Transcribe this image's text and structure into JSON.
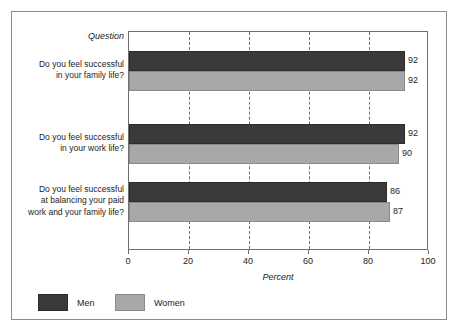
{
  "chart_data": {
    "type": "bar",
    "orientation": "horizontal",
    "title": "",
    "xlabel": "Percent",
    "ylabel": "Question",
    "xlim": [
      0,
      100
    ],
    "xticks": [
      0,
      20,
      40,
      60,
      80,
      100
    ],
    "xtick_labels": [
      "0",
      "20",
      "40",
      "60",
      "80",
      "100"
    ],
    "grid": "vertical-dashed",
    "legend_position": "bottom-left",
    "categories": [
      "Do you feel successful in your family life?",
      "Do you feel successful in your work life?",
      "Do you feel successful at balancing your paid work and your family life?"
    ],
    "category_lines": [
      [
        "Do you feel successful",
        "in your family life?"
      ],
      [
        "Do you feel successful",
        "in your work life?"
      ],
      [
        "Do you feel successful",
        "at balancing your paid",
        "work and your family life?"
      ]
    ],
    "series": [
      {
        "name": "Men",
        "color": "#3a3a3a",
        "values": [
          92,
          92,
          86
        ]
      },
      {
        "name": "Women",
        "color": "#a8a8a8",
        "values": [
          92,
          90,
          87
        ]
      }
    ]
  },
  "axis": {
    "header_label": "Question",
    "x_title": "Percent"
  },
  "legend": {
    "items": [
      {
        "label": "Men",
        "color": "#3a3a3a"
      },
      {
        "label": "Women",
        "color": "#a8a8a8"
      }
    ]
  },
  "colors": {
    "men": "#3a3a3a",
    "women": "#a8a8a8",
    "frame": "#8d8d8d",
    "axis": "#6f6f6f",
    "text": "#1d1d1d",
    "background": "#ffffff"
  }
}
